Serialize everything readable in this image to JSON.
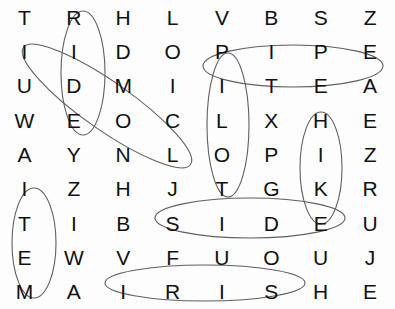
{
  "puzzle": {
    "title": "Word Search Puzzle",
    "rows": 9,
    "columns": 8,
    "ink_color": "#5f5f63",
    "letter_color": "#111111",
    "background_color": "#fdfdfd",
    "grid": [
      [
        "T",
        "R",
        "H",
        "L",
        "V",
        "B",
        "S",
        "Z"
      ],
      [
        "I",
        "I",
        "D",
        "O",
        "P",
        "I",
        "P",
        "E"
      ],
      [
        "U",
        "D",
        "M",
        "I",
        "I",
        "T",
        "E",
        "A"
      ],
      [
        "W",
        "E",
        "O",
        "C",
        "L",
        "X",
        "H",
        "E"
      ],
      [
        "A",
        "Y",
        "N",
        "L",
        "O",
        "P",
        "I",
        "Z"
      ],
      [
        "I",
        "Z",
        "H",
        "J",
        "T",
        "G",
        "K",
        "R"
      ],
      [
        "T",
        "I",
        "B",
        "S",
        "I",
        "D",
        "E",
        "U"
      ],
      [
        "E",
        "W",
        "V",
        "F",
        "U",
        "O",
        "U",
        "J"
      ],
      [
        "M",
        "A",
        "I",
        "R",
        "I",
        "S",
        "H",
        "E"
      ]
    ],
    "found_words": [
      {
        "word": "RIDE",
        "orientation": "vertical",
        "cx": 83,
        "cy": 73,
        "rx": 22,
        "ry": 62,
        "rotate": 0
      },
      {
        "word": "IDOL",
        "orientation": "diagonal",
        "cx": 107,
        "cy": 106,
        "rx": 102,
        "ry": 24,
        "rotate": 35
      },
      {
        "word": "PIPE",
        "orientation": "horizontal",
        "cx": 293,
        "cy": 66,
        "rx": 90,
        "ry": 21,
        "rotate": 0
      },
      {
        "word": "PILOT",
        "orientation": "vertical",
        "cx": 228,
        "cy": 125,
        "rx": 21,
        "ry": 72,
        "rotate": 0
      },
      {
        "word": "HIKE",
        "orientation": "vertical",
        "cx": 321,
        "cy": 168,
        "rx": 21,
        "ry": 56,
        "rotate": 0
      },
      {
        "word": "SIDE",
        "orientation": "horizontal",
        "cx": 250,
        "cy": 218,
        "rx": 95,
        "ry": 20,
        "rotate": 0
      },
      {
        "word": "ITEM",
        "orientation": "vertical",
        "cx": 34,
        "cy": 243,
        "rx": 22,
        "ry": 55,
        "rotate": 0
      },
      {
        "word": "IRISH",
        "orientation": "horizontal",
        "cx": 205,
        "cy": 283,
        "rx": 100,
        "ry": 18,
        "rotate": 0
      }
    ]
  }
}
